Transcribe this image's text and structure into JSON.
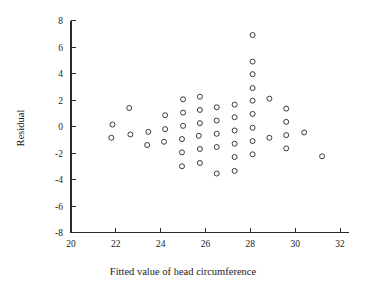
{
  "chart_data": {
    "type": "scatter",
    "title": "",
    "xlabel": "Fitted value of head circumference",
    "ylabel": "Residual",
    "xlim": [
      20,
      32
    ],
    "ylim": [
      -8,
      8
    ],
    "xticks": [
      20,
      22,
      24,
      26,
      28,
      30,
      32
    ],
    "yticks": [
      8,
      6,
      4,
      2,
      0,
      -2,
      -4,
      -6,
      -8
    ],
    "xtick_labels": [
      "20",
      "22",
      "24",
      "26",
      "28",
      "30",
      "32"
    ],
    "ytick_labels": [
      "8",
      "6",
      "4",
      "2",
      "0",
      "-2",
      "-4",
      "-6",
      "-8"
    ],
    "grid": false,
    "legend": null,
    "marker": "open-circle",
    "marker_color": "#3a3a3a",
    "points": [
      {
        "x": 21.85,
        "y": 0.15
      },
      {
        "x": 21.8,
        "y": -0.85
      },
      {
        "x": 22.6,
        "y": 1.4
      },
      {
        "x": 22.65,
        "y": -0.6
      },
      {
        "x": 23.45,
        "y": -0.4
      },
      {
        "x": 23.4,
        "y": -1.4
      },
      {
        "x": 24.2,
        "y": 0.85
      },
      {
        "x": 24.2,
        "y": -0.2
      },
      {
        "x": 24.15,
        "y": -1.15
      },
      {
        "x": 25.0,
        "y": 2.05
      },
      {
        "x": 25.0,
        "y": 1.05
      },
      {
        "x": 25.0,
        "y": 0.05
      },
      {
        "x": 24.95,
        "y": -0.95
      },
      {
        "x": 24.95,
        "y": -1.95
      },
      {
        "x": 24.95,
        "y": -3.0
      },
      {
        "x": 25.75,
        "y": 2.25
      },
      {
        "x": 25.75,
        "y": 1.25
      },
      {
        "x": 25.75,
        "y": 0.25
      },
      {
        "x": 25.7,
        "y": -0.7
      },
      {
        "x": 25.75,
        "y": -1.7
      },
      {
        "x": 25.75,
        "y": -2.75
      },
      {
        "x": 26.5,
        "y": 1.45
      },
      {
        "x": 26.5,
        "y": 0.45
      },
      {
        "x": 26.5,
        "y": -0.55
      },
      {
        "x": 26.5,
        "y": -1.55
      },
      {
        "x": 26.5,
        "y": -3.55
      },
      {
        "x": 27.3,
        "y": 1.65
      },
      {
        "x": 27.3,
        "y": 0.7
      },
      {
        "x": 27.3,
        "y": -0.3
      },
      {
        "x": 27.3,
        "y": -1.3
      },
      {
        "x": 27.3,
        "y": -2.3
      },
      {
        "x": 27.3,
        "y": -3.35
      },
      {
        "x": 28.1,
        "y": 6.9
      },
      {
        "x": 28.1,
        "y": 4.9
      },
      {
        "x": 28.1,
        "y": 3.95
      },
      {
        "x": 28.1,
        "y": 2.9
      },
      {
        "x": 28.1,
        "y": 1.95
      },
      {
        "x": 28.1,
        "y": 0.95
      },
      {
        "x": 28.1,
        "y": -0.1
      },
      {
        "x": 28.1,
        "y": -1.1
      },
      {
        "x": 28.1,
        "y": -2.1
      },
      {
        "x": 28.85,
        "y": 2.1
      },
      {
        "x": 28.85,
        "y": -0.85
      },
      {
        "x": 29.6,
        "y": 1.35
      },
      {
        "x": 29.6,
        "y": 0.35
      },
      {
        "x": 29.6,
        "y": -0.65
      },
      {
        "x": 29.6,
        "y": -1.65
      },
      {
        "x": 30.4,
        "y": -0.45
      },
      {
        "x": 31.2,
        "y": -2.25
      }
    ]
  }
}
